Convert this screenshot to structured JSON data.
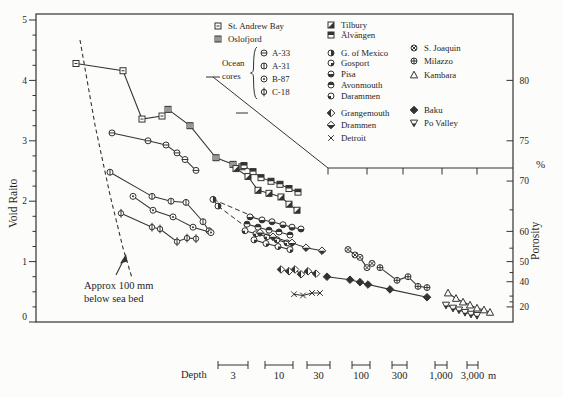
{
  "figure": {
    "bg": "#fcfcfa",
    "ink": "#333333"
  },
  "chart_data": {
    "type": "scatter",
    "title": "",
    "xlabel": "Depth",
    "ylabel": "Void Raito",
    "y2label": "Porosity",
    "y2unit": "%",
    "ylim": [
      0,
      5
    ],
    "yticks": [
      0,
      1,
      2,
      3,
      4,
      5
    ],
    "y2ticks": {
      "major": [
        20,
        40,
        50,
        60,
        70,
        75,
        80
      ],
      "minor": [
        25,
        30,
        45,
        55,
        65
      ]
    },
    "x_axis_note": "non-linear depth scale, see depth interval bars below chart",
    "series": [
      {
        "name": "St. Andrew Bay",
        "symbol": "square-dash",
        "points": [
          [
            76,
            4.28
          ],
          [
            123,
            4.16
          ],
          [
            142,
            3.36
          ],
          [
            162,
            3.41
          ]
        ]
      },
      {
        "name": "Oslofjord",
        "symbol": "square-vlines",
        "points": [
          [
            168,
            3.52
          ],
          [
            190,
            3.25
          ],
          [
            216,
            2.72
          ],
          [
            233,
            2.61
          ],
          [
            242,
            2.57
          ]
        ]
      },
      {
        "name": "A-33",
        "symbol": "circle-hline",
        "points": [
          [
            112,
            3.13
          ],
          [
            148,
            3.0
          ],
          [
            166,
            2.93
          ],
          [
            177,
            2.8
          ],
          [
            185,
            2.69
          ],
          [
            196,
            2.51
          ]
        ]
      },
      {
        "name": "A-31",
        "symbol": "circle-vline",
        "points": [
          [
            110,
            2.48
          ],
          [
            152,
            2.08
          ],
          [
            171,
            2.0
          ],
          [
            186,
            1.98
          ],
          [
            203,
            1.66
          ],
          [
            209,
            1.51
          ]
        ]
      },
      {
        "name": "B-87",
        "symbol": "circle-dot",
        "points": [
          [
            133,
            2.08
          ],
          [
            153,
            1.85
          ],
          [
            173,
            1.74
          ],
          [
            193,
            1.57
          ],
          [
            211,
            1.48
          ]
        ]
      },
      {
        "name": "C-18",
        "symbol": "circle-phi",
        "points": [
          [
            121,
            1.8
          ],
          [
            152,
            1.57
          ],
          [
            160,
            1.54
          ],
          [
            177,
            1.33
          ],
          [
            187,
            1.39
          ],
          [
            196,
            1.38
          ]
        ]
      },
      {
        "name": "G. of Mexico",
        "symbol": "circle-righthalf",
        "points": [
          [
            213,
            2.03
          ],
          [
            218,
            1.92
          ]
        ]
      },
      {
        "name": "Tilbury",
        "symbol": "square-diag",
        "points": [
          [
            236,
            2.54
          ],
          [
            248,
            2.41
          ],
          [
            258,
            2.18
          ],
          [
            269,
            2.13
          ],
          [
            281,
            2.07
          ],
          [
            289,
            1.95
          ],
          [
            297,
            1.85
          ]
        ]
      },
      {
        "name": "Älvängen",
        "symbol": "square-tophalf",
        "points": [
          [
            244,
            2.59
          ],
          [
            253,
            2.49
          ],
          [
            261,
            2.39
          ],
          [
            271,
            2.33
          ],
          [
            280,
            2.28
          ],
          [
            289,
            2.21
          ],
          [
            298,
            2.15
          ]
        ]
      },
      {
        "name": "Pisa",
        "symbol": "circle-bottomhalf",
        "points": [
          [
            250,
            1.74
          ],
          [
            262,
            1.69
          ],
          [
            272,
            1.66
          ],
          [
            283,
            1.61
          ],
          [
            292,
            1.57
          ],
          [
            301,
            1.54
          ]
        ]
      },
      {
        "name": "Avonmouth",
        "symbol": "circle-tophalf",
        "points": [
          [
            247,
            1.62
          ],
          [
            258,
            1.57
          ],
          [
            269,
            1.52
          ],
          [
            279,
            1.49
          ],
          [
            290,
            1.44
          ]
        ]
      },
      {
        "name": "Darammen",
        "symbol": "circle-quarter-bl",
        "points": [
          [
            245,
            1.51
          ],
          [
            256,
            1.46
          ],
          [
            267,
            1.41
          ],
          [
            277,
            1.36
          ],
          [
            287,
            1.31
          ]
        ]
      },
      {
        "name": "Gosport",
        "symbol": "circle-quarter-br",
        "points": [
          [
            254,
            1.36
          ],
          [
            266,
            1.3
          ],
          [
            278,
            1.25
          ],
          [
            290,
            1.2
          ]
        ]
      },
      {
        "name": "Drammen",
        "symbol": "diamond-bottomhalf",
        "points": [
          [
            260,
            1.48
          ],
          [
            273,
            1.41
          ],
          [
            292,
            1.31
          ],
          [
            306,
            1.23
          ],
          [
            322,
            1.18
          ]
        ]
      },
      {
        "name": "Grangemouth",
        "symbol": "diamond-lefthalf",
        "points": [
          [
            281,
            0.87
          ],
          [
            289,
            0.84
          ],
          [
            295,
            0.87
          ],
          [
            301,
            0.79
          ],
          [
            308,
            0.84
          ],
          [
            316,
            0.8
          ]
        ]
      },
      {
        "name": "Detroit",
        "symbol": "x-mark",
        "points": [
          [
            294,
            0.46
          ],
          [
            303,
            0.44
          ],
          [
            312,
            0.48
          ],
          [
            320,
            0.48
          ]
        ]
      },
      {
        "name": "Baku",
        "symbol": "diamond-filled",
        "points": [
          [
            327,
            0.75
          ],
          [
            350,
            0.7
          ],
          [
            360,
            0.66
          ],
          [
            368,
            0.62
          ],
          [
            390,
            0.54
          ],
          [
            427,
            0.41
          ]
        ]
      },
      {
        "name": "S. Joaquin",
        "symbol": "circle-hatch",
        "points": [
          [
            348,
            1.2
          ],
          [
            355,
            1.11
          ],
          [
            360,
            1.07
          ],
          [
            367,
            0.9
          ],
          [
            372,
            0.97
          ]
        ]
      },
      {
        "name": "Milazzo",
        "symbol": "circle-plus",
        "points": [
          [
            380,
            0.9
          ],
          [
            397,
            0.69
          ],
          [
            408,
            0.75
          ],
          [
            418,
            0.59
          ],
          [
            427,
            0.57
          ]
        ]
      },
      {
        "name": "Kambara",
        "symbol": "triangle-up",
        "points": [
          [
            448,
            0.48
          ],
          [
            456,
            0.39
          ],
          [
            463,
            0.33
          ],
          [
            470,
            0.28
          ],
          [
            477,
            0.23
          ],
          [
            484,
            0.2
          ],
          [
            490,
            0.16
          ]
        ]
      },
      {
        "name": "Po Valley",
        "symbol": "triangle-down-half",
        "points": [
          [
            446,
            0.28
          ],
          [
            453,
            0.23
          ],
          [
            459,
            0.2
          ],
          [
            465,
            0.16
          ],
          [
            471,
            0.13
          ],
          [
            477,
            0.11
          ]
        ]
      }
    ],
    "gulf_dashed_rays": [
      [
        [
          213,
          2.03
        ],
        [
          257,
          1.72
        ]
      ],
      [
        [
          218,
          1.92
        ],
        [
          247,
          1.56
        ]
      ]
    ],
    "seabed_dashed_line_px": [
      [
        80,
        40
      ],
      [
        95,
        125
      ],
      [
        110,
        195
      ],
      [
        123,
        248
      ],
      [
        132,
        278
      ]
    ],
    "legend_boundary": {
      "diagonal_px": [
        [
          213,
          77
        ],
        [
          328,
          168
        ]
      ],
      "horizontal_y": 168,
      "horizontal_x2": 513,
      "h_ticks_x": [
        328,
        367,
        403,
        442,
        477
      ],
      "diag_ticks": [
        [
          206,
          220,
          77
        ],
        [
          236,
          248,
          113
        ]
      ]
    },
    "annotation": {
      "line1": "Approx 100 mm",
      "line2": "below sea bed",
      "arrow_from": [
        116,
        275
      ],
      "arrow_to": [
        125,
        256
      ]
    },
    "depth_scale": {
      "label": "Depth",
      "unit": "m",
      "bar_y": 365,
      "label_y": 379,
      "items": [
        {
          "text": "3",
          "x1": 218,
          "x2": 248
        },
        {
          "text": "10",
          "x1": 265,
          "x2": 293
        },
        {
          "text": "30",
          "x1": 307,
          "x2": 330
        },
        {
          "text": "100",
          "x1": 352,
          "x2": 370
        },
        {
          "text": "300",
          "x1": 392,
          "x2": 407
        },
        {
          "text": "1,000",
          "x1": 435,
          "x2": 447
        },
        {
          "text": "3,000",
          "x1": 467,
          "x2": 478
        }
      ]
    },
    "legend": {
      "col1": {
        "x_sym": 218,
        "x_label": 228,
        "rows": [
          {
            "y": 26,
            "symbol": "square-dash",
            "label": "St. Andrew Bay"
          },
          {
            "y": 39,
            "symbol": "square-vlines",
            "label": "Oslofjord"
          }
        ]
      },
      "ocean_cores": {
        "text": [
          "Ocean",
          "cores"
        ],
        "text_x": 222,
        "text_y": [
          66,
          79
        ],
        "brace_x": 254,
        "brace_y1": 47,
        "brace_y2": 99,
        "x_sym": 264,
        "x_label": 272,
        "rows": [
          {
            "y": 53,
            "symbol": "circle-hline",
            "label": "A-33"
          },
          {
            "y": 66,
            "symbol": "circle-vline",
            "label": "A-31"
          },
          {
            "y": 79,
            "symbol": "circle-dot",
            "label": "B-87"
          },
          {
            "y": 92,
            "symbol": "circle-phi",
            "label": "C-18"
          }
        ]
      },
      "col2": {
        "x_sym": 331,
        "x_label": 341,
        "rows": [
          {
            "y": 25,
            "symbol": "square-diag",
            "label": "Tilbury"
          },
          {
            "y": 35,
            "symbol": "square-tophalf",
            "label": "Älvängen"
          },
          {
            "y": 53,
            "symbol": "circle-righthalf",
            "label": "G. of Mexico"
          },
          {
            "y": 63,
            "symbol": "circle-quarter-br",
            "label": "Gosport"
          },
          {
            "y": 74,
            "symbol": "circle-bottomhalf",
            "label": "Pisa"
          },
          {
            "y": 85,
            "symbol": "circle-tophalf",
            "label": "Avonmouth"
          },
          {
            "y": 96,
            "symbol": "circle-quarter-bl",
            "label": "Darammen"
          },
          {
            "y": 113,
            "symbol": "diamond-lefthalf",
            "label": "Grangemouth"
          },
          {
            "y": 125,
            "symbol": "diamond-bottomhalf",
            "label": "Drammen"
          },
          {
            "y": 138,
            "symbol": "x-mark",
            "label": "Detroit"
          }
        ]
      },
      "col3": {
        "x_sym": 414,
        "x_label": 424,
        "rows": [
          {
            "y": 48,
            "symbol": "circle-hatch",
            "label": "S. Joaquin"
          },
          {
            "y": 61,
            "symbol": "circle-plus",
            "label": "Milazzo"
          },
          {
            "y": 75,
            "symbol": "triangle-up",
            "label": "Kambara"
          },
          {
            "y": 110,
            "symbol": "diamond-filled",
            "label": "Baku"
          },
          {
            "y": 123,
            "symbol": "triangle-down-half",
            "label": "Po Valley"
          }
        ]
      }
    }
  }
}
